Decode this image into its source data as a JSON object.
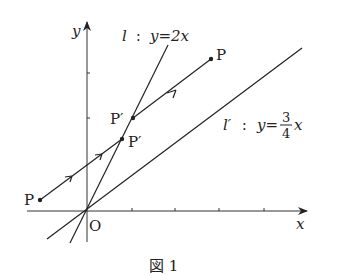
{
  "figure": {
    "caption": "図 1",
    "axes": {
      "x_label": "x",
      "y_label": "y",
      "origin_label": "O"
    },
    "line_l": {
      "name": "l",
      "sep": ":",
      "equation": "y=2x"
    },
    "line_l_prime": {
      "name": "l′",
      "sep": ":",
      "eq_left": "y=",
      "numerator": "3",
      "denominator": "4",
      "eq_right": "x"
    },
    "points": [
      {
        "label": "P",
        "position": "upper-right"
      },
      {
        "label": "P′",
        "position": "upper-on-l"
      },
      {
        "label": "P′",
        "position": "lower-on-l"
      },
      {
        "label": "P",
        "position": "left"
      }
    ],
    "colors": {
      "ink": "#222222",
      "background": "#ffffff"
    }
  }
}
